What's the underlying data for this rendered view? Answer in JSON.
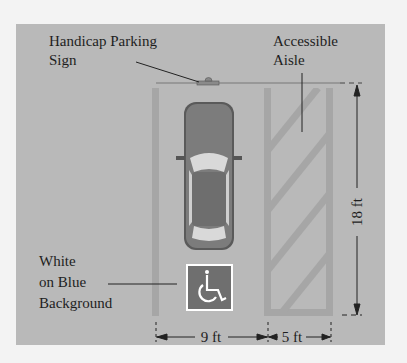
{
  "diagram": {
    "labels": {
      "sign_line1": "Handicap Parking",
      "sign_line2": "Sign",
      "aisle_line1": "Accessible",
      "aisle_line2": "Aisle",
      "symbol_line1": "White",
      "symbol_line2": "on Blue",
      "symbol_line3": "Background"
    },
    "dimensions": {
      "space_width": "9 ft",
      "aisle_width": "5 ft",
      "length": "18 ft"
    },
    "icons": {
      "car": "car-topview-icon",
      "symbol": "wheelchair-accessible-icon",
      "sign": "parking-sign-icon"
    },
    "colors": {
      "background": "#b9b9b9",
      "stripes": "#a6a6a6",
      "symbol_background": "#6f6f6f",
      "symbol_foreground": "#ffffff",
      "car_body": "#7c7c7c"
    }
  }
}
